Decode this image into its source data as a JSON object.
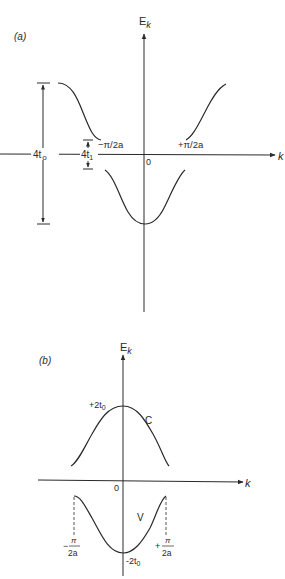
{
  "panel_a": {
    "label": "(a)",
    "y_axis_label": "E",
    "y_axis_sub": "k",
    "x_axis_label": "k",
    "origin_label": "0",
    "neg_boundary": "−π/2a",
    "pos_boundary": "+π/2a",
    "bandwidth_label_main": "4t",
    "bandwidth_label_sub": "o",
    "gap_label_main": "4t",
    "gap_label_sub": "1"
  },
  "panel_b": {
    "label": "(b)",
    "y_axis_label": "E",
    "y_axis_sub": "k",
    "x_axis_label": "k",
    "origin_label": "0",
    "top_value_main": "+2t",
    "top_value_sub": "0",
    "bottom_value_main": "-2t",
    "bottom_value_sub": "0",
    "conduction_band": "C",
    "valence_band": "V",
    "neg_boundary_sign": "−",
    "pos_boundary_sign": "+",
    "boundary_numerator": "π",
    "boundary_denominator": "2a"
  },
  "colors": {
    "line": "#2a2a2a",
    "background": "#ffffff"
  }
}
